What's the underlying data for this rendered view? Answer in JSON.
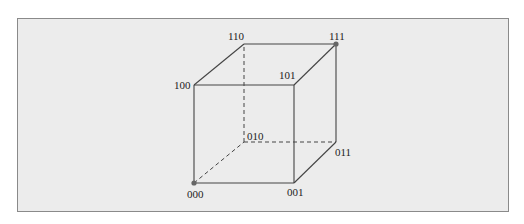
{
  "diagram": {
    "type": "cube",
    "vertices": [
      {
        "id": "000",
        "label": "000",
        "x": 194,
        "y": 183,
        "highlighted": true
      },
      {
        "id": "001",
        "label": "001",
        "x": 294,
        "y": 183,
        "highlighted": false
      },
      {
        "id": "010",
        "label": "010",
        "x": 244,
        "y": 142,
        "highlighted": false
      },
      {
        "id": "011",
        "label": "011",
        "x": 336,
        "y": 142,
        "highlighted": false
      },
      {
        "id": "100",
        "label": "100",
        "x": 194,
        "y": 85,
        "highlighted": false
      },
      {
        "id": "101",
        "label": "101",
        "x": 294,
        "y": 85,
        "highlighted": false
      },
      {
        "id": "110",
        "label": "110",
        "x": 244,
        "y": 44,
        "highlighted": false
      },
      {
        "id": "111",
        "label": "111",
        "x": 336,
        "y": 44,
        "highlighted": true
      }
    ],
    "edges": [
      {
        "from": "000",
        "to": "001",
        "style": "solid"
      },
      {
        "from": "000",
        "to": "100",
        "style": "solid"
      },
      {
        "from": "100",
        "to": "101",
        "style": "solid"
      },
      {
        "from": "001",
        "to": "101",
        "style": "solid"
      },
      {
        "from": "100",
        "to": "110",
        "style": "solid"
      },
      {
        "from": "110",
        "to": "111",
        "style": "solid"
      },
      {
        "from": "101",
        "to": "111",
        "style": "solid"
      },
      {
        "from": "111",
        "to": "011",
        "style": "solid"
      },
      {
        "from": "001",
        "to": "011",
        "style": "solid"
      },
      {
        "from": "000",
        "to": "010",
        "style": "dashed"
      },
      {
        "from": "010",
        "to": "011",
        "style": "dashed"
      },
      {
        "from": "010",
        "to": "110",
        "style": "dashed"
      }
    ]
  },
  "labels": {
    "v000": "000",
    "v001": "001",
    "v010": "010",
    "v011": "011",
    "v100": "100",
    "v101": "101",
    "v110": "110",
    "v111": "111"
  },
  "colors": {
    "frame_background": "#ececec",
    "frame_border": "#8a8a8a",
    "edge": "#444444",
    "dot": "#666666"
  }
}
